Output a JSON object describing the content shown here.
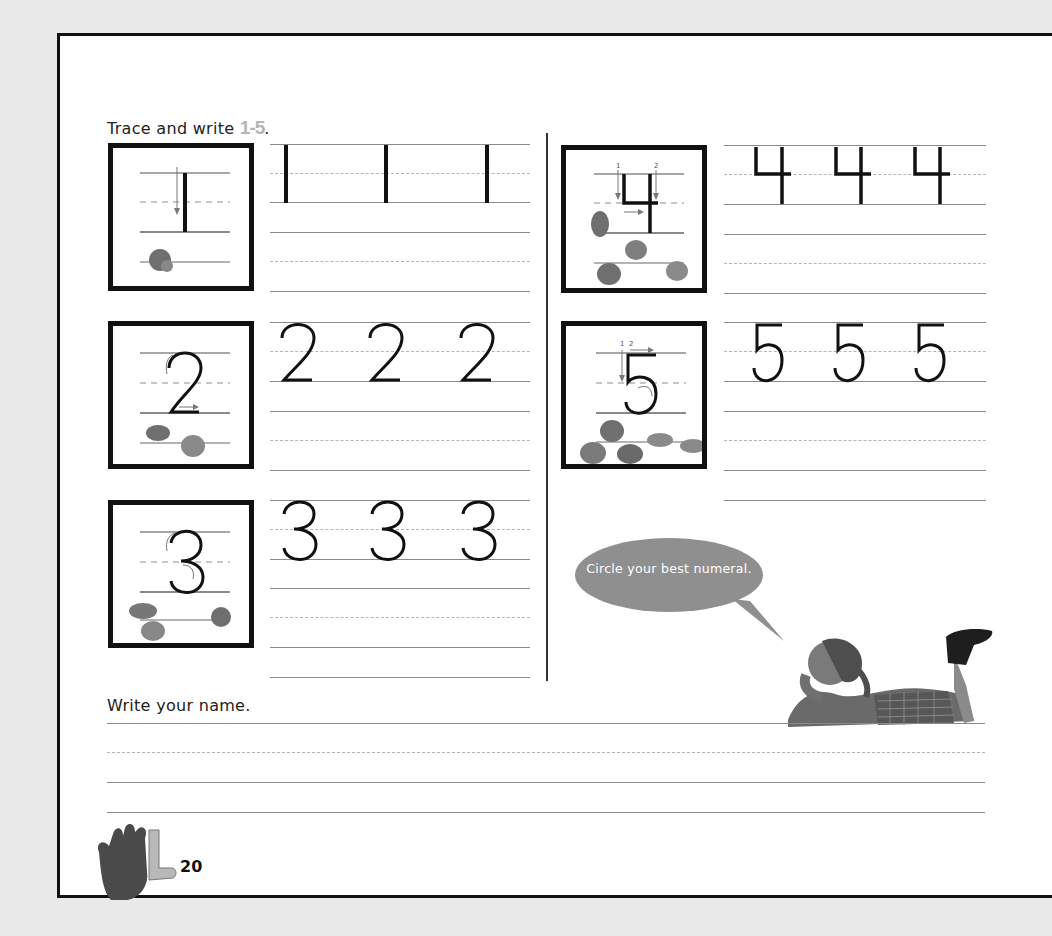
{
  "page": {
    "instruction_prefix": "Trace and write ",
    "instruction_range": "1-5",
    "instruction_suffix": ".",
    "name_prompt": "Write your name.",
    "page_number": "20",
    "speech_bubble": "Circle your best numeral.",
    "colors": {
      "border": "#111111",
      "bubble": "#8f8f8f",
      "range_text": "#b5b5b5",
      "guide_line": "#8a8a8a",
      "dashed_line": "#b4b4b4"
    }
  },
  "numerals": [
    {
      "digit": "1",
      "model_label": "Model numeral 1 with stroke arrow",
      "counters": 1,
      "practice": [
        "1",
        "1",
        "1"
      ]
    },
    {
      "digit": "2",
      "model_label": "Model numeral 2 with stroke arrows",
      "counters": 2,
      "practice": [
        "2",
        "2",
        "2"
      ]
    },
    {
      "digit": "3",
      "model_label": "Model numeral 3 with stroke arrows",
      "counters": 3,
      "practice": [
        "3",
        "3",
        "3"
      ]
    },
    {
      "digit": "4",
      "model_label": "Model numeral 4 with stroke arrows 1 and 2",
      "counters": 4,
      "practice": [
        "4",
        "4",
        "4"
      ]
    },
    {
      "digit": "5",
      "model_label": "Model numeral 5 with stroke arrows 1 and 2",
      "counters": 5,
      "practice": [
        "5",
        "5",
        "5"
      ]
    }
  ],
  "stroke_labels": {
    "one": "1",
    "two": "2"
  },
  "icons": {
    "hand": "hand-sign-L-icon",
    "girl": "girl-lying-illustration",
    "counter": "pebble-counter-icon"
  }
}
